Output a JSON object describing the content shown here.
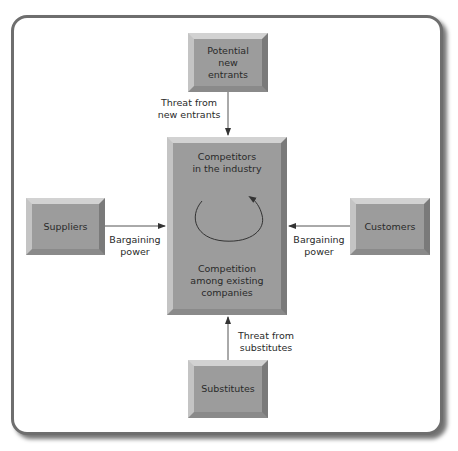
{
  "diagram": {
    "colors": {
      "box_fill": "#9c9c9c",
      "frame_border": "#6e6e6e",
      "arrow": "#333333",
      "background": "#ffffff"
    },
    "nodes": {
      "new_entrants": {
        "label": "Potential\nnew\nentrants"
      },
      "suppliers": {
        "label": "Suppliers"
      },
      "customers": {
        "label": "Customers"
      },
      "substitutes": {
        "label": "Substitutes"
      },
      "central": {
        "top_label": "Competitors\nin the industry",
        "bottom_label": "Competition\namong existing\ncompanies"
      }
    },
    "edges": [
      {
        "from": "new_entrants",
        "to": "central",
        "label": "Threat from\nnew entrants"
      },
      {
        "from": "suppliers",
        "to": "central",
        "label": "Bargaining\npower"
      },
      {
        "from": "customers",
        "to": "central",
        "label": "Bargaining\npower"
      },
      {
        "from": "substitutes",
        "to": "central",
        "label": "Threat from\nsubstitutes"
      }
    ],
    "central_icon": "circular-arrow-icon"
  }
}
